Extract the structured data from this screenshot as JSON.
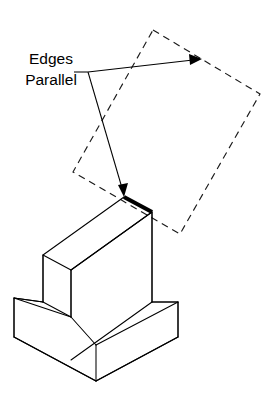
{
  "figure": {
    "background_color": "#ffffff",
    "line_color": "#000000",
    "width": 275,
    "height": 400
  },
  "callout": {
    "name": "edges-parallel-callout",
    "line1": "Edges",
    "line2": "Parallel",
    "line1_x": 51,
    "line1_y": 64,
    "line2_x": 51,
    "line2_y": 85,
    "font_size": 15.5,
    "color": "#000000"
  },
  "leader": {
    "name": "leader-lines",
    "origin_x": 88,
    "origin_y": 72,
    "stub_start_x": 74,
    "stub_start_y": 72,
    "upper_arrow_tip_x": 201,
    "upper_arrow_tip_y": 59,
    "lower_arrow_tip_x": 124,
    "lower_arrow_tip_y": 197,
    "color": "#000000",
    "stroke_width": 1.05
  },
  "phantom_square": {
    "name": "dashed-construction-square",
    "label": "rotated dashed square",
    "dash_pattern": "7 5",
    "stroke_width": 1.15,
    "color": "#1a1a1a",
    "points": "153,30 260,94 180,234 73,172",
    "corners": [
      {
        "name": "top",
        "x": 153,
        "y": 30
      },
      {
        "name": "right",
        "x": 260,
        "y": 94
      },
      {
        "name": "bottom",
        "x": 180,
        "y": 234
      },
      {
        "name": "left",
        "x": 73,
        "y": 172
      }
    ]
  },
  "highlight": {
    "name": "highlighted-top-back-edge",
    "x1": 124,
    "y1": 197,
    "x2": 152,
    "y2": 212,
    "stroke_width": 4.2,
    "color": "#000000"
  },
  "solid_object": {
    "name": "isometric-t-block",
    "description": "T-shaped block drawn in isometric projection",
    "paths": [
      {
        "name": "upright-top-face",
        "d": "M 43 255 L 124 197 L 152 212 L 71 270 Z"
      },
      {
        "name": "upright-front-face",
        "d": "M 71 270 L 152 212 L 152 302 L 71 360"
      },
      {
        "name": "upright-left-face",
        "d": "M 43 255 L 43 302 L 71 317 L 71 270"
      },
      {
        "name": "base-top-face",
        "d": "M 43 302 L 14 298 L 14 337 L 96 381 L 178 337 L 178 302 L 152 302"
      },
      {
        "name": "base-top-left-ledge",
        "d": "M 14 298 L 43 302"
      },
      {
        "name": "base-upper-right-edge",
        "d": "M 152 302 L 178 302"
      },
      {
        "name": "base-front-left-face",
        "d": "M 14 337 L 96 381"
      },
      {
        "name": "base-front-right-face",
        "d": "M 96 381 L 178 337"
      },
      {
        "name": "base-vertical-left",
        "d": "M 14 298 L 14 337"
      },
      {
        "name": "base-vertical-front",
        "d": "M 96 345 L 96 381"
      },
      {
        "name": "base-vertical-right",
        "d": "M 178 302 L 178 337"
      },
      {
        "name": "base-top-front-left-diagonal",
        "d": "M 14 298 L 71 317"
      },
      {
        "name": "base-top-front-right-diagonal",
        "d": "M 71 317 L 96 345"
      },
      {
        "name": "base-top-right-diagonal",
        "d": "M 96 345 L 178 302"
      },
      {
        "name": "upright-vertical-right",
        "d": "M 152 212 L 152 302"
      },
      {
        "name": "upright-vertical-front",
        "d": "M 71 270 L 71 317"
      },
      {
        "name": "upright-vertical-left-rear",
        "d": "M 43 255 L 43 302"
      }
    ]
  }
}
